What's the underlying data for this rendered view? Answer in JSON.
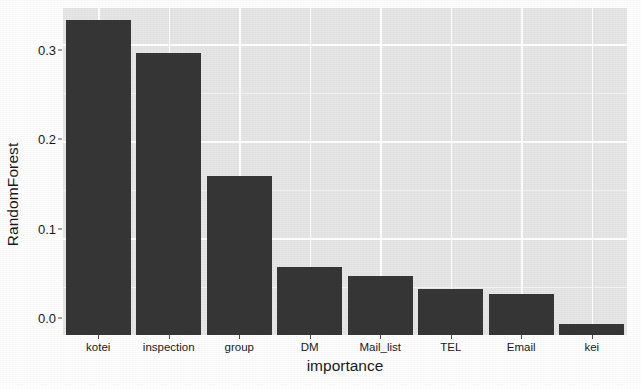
{
  "chart_data": {
    "type": "bar",
    "title": "",
    "subtitle": "",
    "xlabel": "importance",
    "ylabel": "RandomForest",
    "categories": [
      "kotei",
      "inspection",
      "group",
      "DM",
      "Mail_list",
      "TEL",
      "Email",
      "kei"
    ],
    "values": [
      0.325,
      0.291,
      0.164,
      0.07,
      0.061,
      0.047,
      0.042,
      0.011
    ],
    "ylim": [
      0.0,
      0.3375
    ],
    "ytick_labels": [
      "0.0",
      "0.1",
      "0.2",
      "0.3"
    ],
    "ytick_values": [
      0.0,
      0.1,
      0.2,
      0.3
    ],
    "yminor_values": [
      0.05,
      0.15,
      0.25
    ],
    "grid": true,
    "legend": "none",
    "bar_color": "#363636",
    "panel_color": "#e6e6e6",
    "gridline_color": "#ffffff",
    "text_color": "#1a1a1a",
    "annotations": []
  }
}
